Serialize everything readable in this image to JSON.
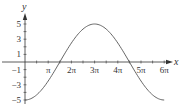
{
  "chart_data": {
    "type": "line",
    "title": "",
    "xlabel": "x",
    "ylabel": "y",
    "function": "y = -5 cos(x/3)",
    "x_ticks": [
      "π",
      "2π",
      "3π",
      "4π",
      "5π",
      "6π"
    ],
    "x_tick_values_in_pi": [
      1,
      2,
      3,
      4,
      5,
      6
    ],
    "y_ticks": [
      "5",
      "3",
      "1",
      "−1",
      "−3",
      "−5"
    ],
    "y_tick_values": [
      5,
      3,
      1,
      -1,
      -3,
      -5
    ],
    "xlim_in_pi": [
      0,
      6.3
    ],
    "ylim": [
      -5.2,
      5.8
    ],
    "grid": false,
    "legend": null,
    "series": [
      {
        "name": "y = -5cos(x/3)",
        "x_in_pi": [
          0,
          0.5,
          1,
          1.5,
          2,
          2.5,
          3,
          3.5,
          4,
          4.5,
          5,
          5.5,
          6
        ],
        "y": [
          -5,
          -4.33,
          -2.5,
          0,
          2.5,
          4.33,
          5,
          4.33,
          2.5,
          0,
          -2.5,
          -4.33,
          -5
        ]
      }
    ],
    "colors": {
      "axis": "#333333",
      "curve": "#555555"
    }
  }
}
